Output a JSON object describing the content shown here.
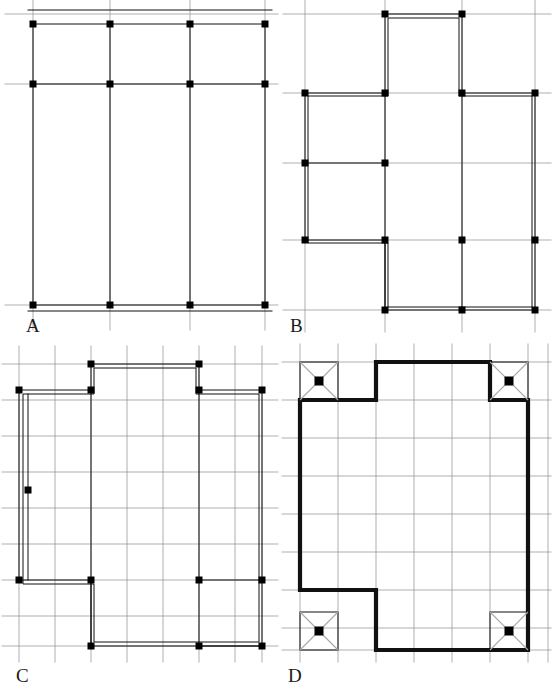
{
  "figure": {
    "width": 553,
    "height": 690,
    "background": "#ffffff",
    "type": "technical-floor-plan-diagram",
    "colors": {
      "member": "#111111",
      "grid": "#8c8c8c",
      "grid_light": "#a8a8a8",
      "node": "#000000",
      "paper": "#ffffff",
      "label": "#1a1a1a"
    },
    "stroke_widths": {
      "heavy_member": 3.2,
      "medium_member": 2.0,
      "thin_member": 1.4,
      "grid": 0.7
    },
    "node_size": 7
  },
  "panels": [
    {
      "id": "A",
      "label": "A",
      "name": "panel-a-regular-grid-frame",
      "caption": "Regular rectangular frame with four column lines and three beam levels",
      "viewbox": "0 0 280 340",
      "grid": {
        "x_lines": [
          33,
          110,
          190,
          265
        ],
        "y_lines": [
          14,
          84,
          305
        ],
        "x_extent": [
          5,
          278
        ],
        "y_extent": [
          0,
          330
        ]
      },
      "columns_x": [
        33,
        110,
        190,
        265
      ],
      "beams_y": [
        24,
        84,
        305
      ],
      "column_top": 24,
      "column_bottom": 305,
      "outer_rails": [
        {
          "y": 10,
          "x1": 28,
          "x2": 272
        },
        {
          "y": 311,
          "x1": 28,
          "x2": 272
        }
      ],
      "nodes": [
        {
          "x": 33,
          "y": 24
        },
        {
          "x": 110,
          "y": 24
        },
        {
          "x": 190,
          "y": 24
        },
        {
          "x": 265,
          "y": 24
        },
        {
          "x": 33,
          "y": 84
        },
        {
          "x": 110,
          "y": 84
        },
        {
          "x": 190,
          "y": 84
        },
        {
          "x": 265,
          "y": 84
        },
        {
          "x": 33,
          "y": 305
        },
        {
          "x": 110,
          "y": 305
        },
        {
          "x": 190,
          "y": 305
        },
        {
          "x": 265,
          "y": 305
        }
      ],
      "node_count": 12
    },
    {
      "id": "B",
      "label": "B",
      "name": "panel-b-cruciform-frame",
      "caption": "Cruciform plan with raised central top bay and stepped lower left corner",
      "viewbox": "0 0 273 340",
      "grid": {
        "x_lines": [
          25,
          105,
          182,
          255
        ],
        "y_lines": [
          14,
          93,
          163,
          240,
          310
        ],
        "x_extent": [
          3,
          271
        ],
        "y_extent": [
          0,
          332
        ]
      },
      "outline": "M 105 14 L 182 14 L 182 93 L 255 93 L 255 310 L 105 310 L 105 240 L 25 240 L 25 93 L 105 93 Z",
      "outline_rail": "M 108 18 L 179 18 L 179 96 L 252 96 L 252 307 L 108 307 L 108 243 L 28 243 L 28 96 L 108 96 Z",
      "interior_members": [
        {
          "type": "vertical",
          "x": 105,
          "y1": 93,
          "y2": 310
        },
        {
          "type": "vertical",
          "x": 182,
          "y1": 93,
          "y2": 310
        },
        {
          "type": "horizontal",
          "y": 163,
          "x1": 25,
          "x2": 105
        }
      ],
      "nodes": [
        {
          "x": 105,
          "y": 14
        },
        {
          "x": 182,
          "y": 14
        },
        {
          "x": 25,
          "y": 93
        },
        {
          "x": 105,
          "y": 93
        },
        {
          "x": 182,
          "y": 93
        },
        {
          "x": 255,
          "y": 93
        },
        {
          "x": 25,
          "y": 163
        },
        {
          "x": 105,
          "y": 163
        },
        {
          "x": 25,
          "y": 240
        },
        {
          "x": 105,
          "y": 240
        },
        {
          "x": 182,
          "y": 240
        },
        {
          "x": 255,
          "y": 240
        },
        {
          "x": 105,
          "y": 310
        },
        {
          "x": 182,
          "y": 310
        },
        {
          "x": 255,
          "y": 310
        }
      ],
      "node_count": 15
    },
    {
      "id": "C",
      "label": "C",
      "name": "panel-c-fine-mesh-frame",
      "caption": "Stepped plan over a fine orthogonal mesh with perimeter and interior framing lines",
      "viewbox": "0 0 280 330",
      "grid": {
        "x_step": 36,
        "y_step": 36,
        "x_lines": [
          19,
          55,
          91,
          127,
          163,
          199,
          235,
          262
        ],
        "y_lines": [
          24,
          60,
          96,
          132,
          168,
          204,
          240,
          276,
          306
        ],
        "x_extent": [
          2,
          278
        ],
        "y_extent": [
          6,
          322
        ]
      },
      "outline": "M 91 24 L 199 24 L 199 50 L 262 50 L 262 306 L 91 306 L 91 240 L 19 240 L 19 50 L 91 50 Z",
      "outline_rail": "M 94 28 L 196 28 L 196 54 L 259 54 L 259 302 L 94 302 L 94 244 L 23 244 L 23 54 L 94 54 Z",
      "interior_members": [
        {
          "type": "vertical",
          "x": 91,
          "y1": 50,
          "y2": 306
        },
        {
          "type": "vertical",
          "x": 199,
          "y1": 50,
          "y2": 306
        },
        {
          "type": "vertical",
          "x": 28,
          "y1": 54,
          "y2": 240
        },
        {
          "type": "horizontal",
          "y": 240,
          "x1": 199,
          "x2": 262
        },
        {
          "type": "horizontal",
          "y": 306,
          "x1": 199,
          "x2": 262
        }
      ],
      "nodes": [
        {
          "x": 91,
          "y": 24
        },
        {
          "x": 199,
          "y": 24
        },
        {
          "x": 19,
          "y": 50
        },
        {
          "x": 91,
          "y": 50
        },
        {
          "x": 199,
          "y": 50
        },
        {
          "x": 262,
          "y": 50
        },
        {
          "x": 28,
          "y": 150
        },
        {
          "x": 19,
          "y": 240
        },
        {
          "x": 91,
          "y": 240
        },
        {
          "x": 199,
          "y": 240
        },
        {
          "x": 262,
          "y": 240
        },
        {
          "x": 91,
          "y": 306
        },
        {
          "x": 199,
          "y": 306
        },
        {
          "x": 262,
          "y": 306
        }
      ],
      "node_count": 14
    },
    {
      "id": "D",
      "label": "D",
      "name": "panel-d-shearwall-frame",
      "caption": "Bold perimeter outline with four braced corner cells marked by diagonal crosses and central studs",
      "viewbox": "0 0 273 330",
      "grid": {
        "x_lines": [
          20,
          58,
          96,
          134,
          172,
          210,
          248,
          268
        ],
        "y_lines": [
          22,
          60,
          98,
          136,
          174,
          212,
          250,
          288,
          310
        ],
        "x_extent": [
          2,
          271
        ],
        "y_extent": [
          4,
          322
        ]
      },
      "outline": "M 20 60 L 20 250 L 96 250 L 96 310 L 248 310 L 248 60 L 210 60 L 210 22 L 96 22 L 96 60 Z",
      "corner_cells": [
        {
          "name": "top-left",
          "x": 20,
          "y": 22,
          "w": 38,
          "h": 38
        },
        {
          "name": "top-right",
          "x": 210,
          "y": 22,
          "w": 38,
          "h": 38
        },
        {
          "name": "bottom-left",
          "x": 20,
          "y": 272,
          "w": 38,
          "h": 38
        },
        {
          "name": "bottom-right",
          "x": 210,
          "y": 272,
          "w": 38,
          "h": 38
        }
      ],
      "corner_marker": "diagonal-cross-with-center-stud",
      "corner_stud_size": 9,
      "node_count": 4
    }
  ]
}
